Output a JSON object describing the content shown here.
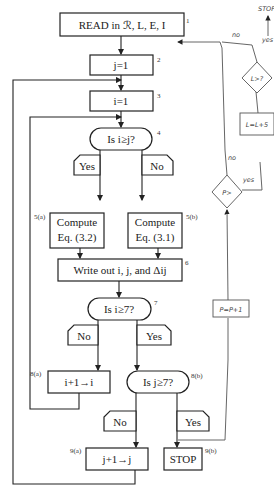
{
  "flowchart": {
    "nodes": [
      {
        "id": "1",
        "label": "READ in ℛ, L, E, I",
        "shape": "process"
      },
      {
        "id": "2",
        "label": "j=1",
        "shape": "process"
      },
      {
        "id": "3",
        "label": "i=1",
        "shape": "process"
      },
      {
        "id": "4",
        "label": "Is i≥j?",
        "shape": "decision"
      },
      {
        "id": "5a",
        "label": "Compute",
        "label2": "Eq. (3.2)",
        "shape": "process",
        "tag": "5(a)"
      },
      {
        "id": "5b",
        "label": "Compute",
        "label2": "Eq. (3.1)",
        "shape": "process",
        "tag": "5(b)"
      },
      {
        "id": "6",
        "label": "Write out i, j, and Δij",
        "shape": "process"
      },
      {
        "id": "7",
        "label": "Is i≥7?",
        "shape": "decision"
      },
      {
        "id": "8a",
        "label": "i+1→i",
        "shape": "process",
        "tag": "8(a)"
      },
      {
        "id": "8b",
        "label": "Is j≥7?",
        "shape": "decision",
        "tag": "8(b)"
      },
      {
        "id": "9a",
        "label": "j+1→j",
        "shape": "process",
        "tag": "9(a)"
      },
      {
        "id": "9b",
        "label": "STOP",
        "shape": "terminal",
        "tag": "9(b)"
      }
    ],
    "branch_labels": {
      "d4_yes": "Yes",
      "d4_no": "No",
      "d7_no": "No",
      "d7_yes": "Yes",
      "d8_no": "No",
      "d8_yes": "Yes"
    },
    "handwritten": {
      "top_stop": "STOP",
      "top_yes": "yes",
      "top_no": "no",
      "diamond_L": "L>?",
      "box_L": "L=L+5",
      "no_label": "no",
      "diamond_P": "P>",
      "yes_label": "yes",
      "box_P": "P=P+1"
    }
  }
}
